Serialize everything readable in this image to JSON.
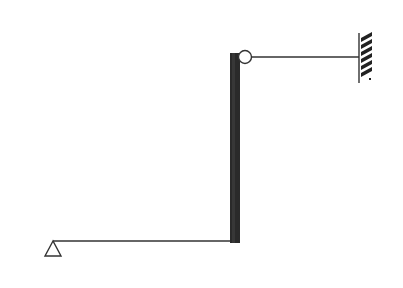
{
  "diagram": {
    "title": "",
    "colors": {
      "line": "#333333",
      "column": "#2a2a2a",
      "hatch": "#222222",
      "background": "#ffffff"
    },
    "elements": {
      "pin_support": {
        "apex": [
          53,
          241
        ],
        "base_y": 256,
        "half_width": 8
      },
      "horizontal_beam": {
        "x1": 53,
        "y1": 241,
        "x2": 231,
        "y2": 241
      },
      "vertical_column": {
        "x": 230,
        "y": 53,
        "width": 10,
        "height": 190
      },
      "hinge": {
        "cx": 245,
        "cy": 57,
        "r": 6.5
      },
      "tie_rod": {
        "x1": 252,
        "y1": 57,
        "x2": 359,
        "y2": 57
      },
      "fixed_wall": {
        "x": 359,
        "y1": 33,
        "y2": 83,
        "hatch_width": 12
      }
    },
    "labels": []
  }
}
